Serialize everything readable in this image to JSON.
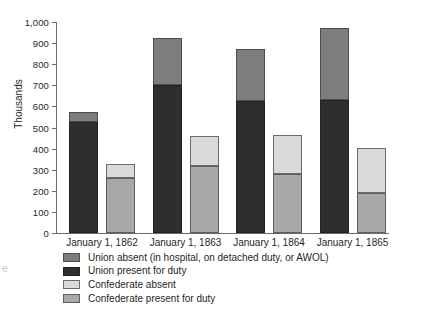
{
  "chart_data": {
    "type": "bar",
    "subtype": "grouped-stacked",
    "title": "",
    "xlabel": "",
    "ylabel": "Thousands",
    "ylim": [
      0,
      1000
    ],
    "ytick_step": 100,
    "yticks": [
      "1,000",
      "900",
      "800",
      "700",
      "600",
      "500",
      "400",
      "300",
      "200",
      "100",
      "0"
    ],
    "ytick_values": [
      1000,
      900,
      800,
      700,
      600,
      500,
      400,
      300,
      200,
      100,
      0
    ],
    "grid": false,
    "legend_position": "below",
    "categories": [
      "January 1, 1862",
      "January 1, 1863",
      "January 1, 1864",
      "January 1, 1865"
    ],
    "series": [
      {
        "name": "Union absent (in hospital, on detached duty, or AWOL)",
        "key": "union-absent",
        "color": "#7d7d7d",
        "stack": "union",
        "values": [
          45,
          220,
          246,
          340
        ]
      },
      {
        "name": "Union present for duty",
        "key": "union-present",
        "color": "#2e2e2e",
        "stack": "union",
        "values": [
          528,
          702,
          627,
          632
        ]
      },
      {
        "name": "Confederate absent",
        "key": "conf-absent",
        "color": "#d9d9d9",
        "stack": "confederate",
        "values": [
          65,
          142,
          187,
          216
        ]
      },
      {
        "name": "Confederate present for duty",
        "key": "conf-present",
        "color": "#a8a8a8",
        "stack": "confederate",
        "values": [
          263,
          316,
          278,
          189
        ]
      }
    ],
    "stack_totals": {
      "union": [
        573,
        922,
        873,
        972
      ],
      "confederate": [
        328,
        458,
        465,
        405
      ]
    }
  },
  "legend": {
    "items": [
      {
        "label": "Union absent (in hospital, on detached duty, or AWOL)",
        "swatch": "union-absent"
      },
      {
        "label": "Union present for duty",
        "swatch": "union-present"
      },
      {
        "label": "Confederate absent",
        "swatch": "conf-absent"
      },
      {
        "label": "Confederate present for duty",
        "swatch": "conf-present"
      }
    ]
  },
  "page_artifact": {
    "text": "e"
  }
}
